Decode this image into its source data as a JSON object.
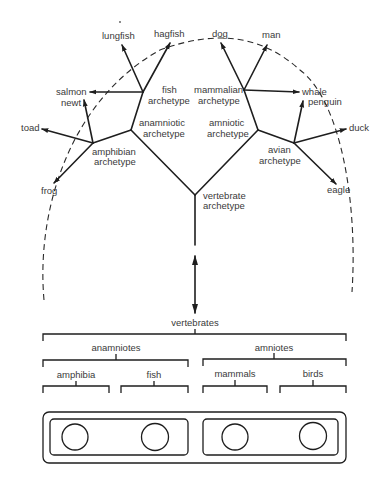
{
  "tree": {
    "archetypes": {
      "vertebrate": [
        "vertebrate",
        "archetype"
      ],
      "anamniotic": [
        "anamniotic",
        "archetype"
      ],
      "amniotic": [
        "amniotic",
        "archetype"
      ],
      "fish": [
        "fish",
        "archetype"
      ],
      "mammalian": [
        "mammalian",
        "archetype"
      ],
      "amphibian": [
        "amphibian",
        "archetype"
      ],
      "avian": [
        "avian",
        "archetype"
      ]
    },
    "leaves": {
      "lungfish": "lungfish",
      "hagfish": "hagfish",
      "salmon": "salmon",
      "newt": "newt",
      "toad": "toad",
      "frog": "frog",
      "dog": "dog",
      "man": "man",
      "whale": "whale",
      "penguin": "penguin",
      "duck": "duck",
      "eagle": "eagle"
    }
  },
  "classification": {
    "root": "vertebrates",
    "groups": [
      {
        "label": "anamniotes",
        "children": [
          "amphibia",
          "fish"
        ]
      },
      {
        "label": "amniotes",
        "children": [
          "mammals",
          "birds"
        ]
      }
    ]
  },
  "colors": {
    "ink": "#1e1e1e",
    "text": "#3a3a3a",
    "background": "#ffffff"
  }
}
